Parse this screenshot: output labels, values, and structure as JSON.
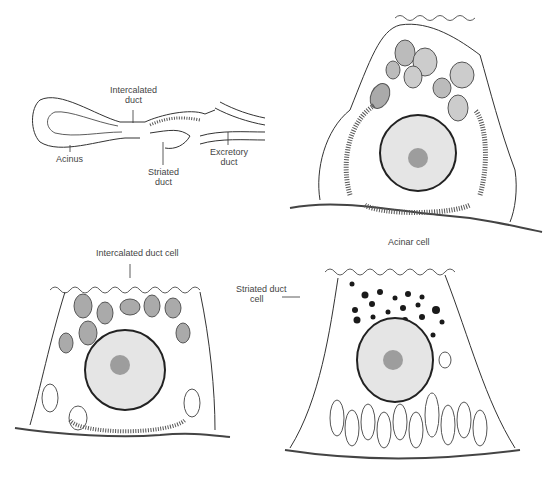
{
  "figure": {
    "panels": [
      {
        "id": "duct-system",
        "labels": {
          "intercalated_line1": "Intercalated",
          "intercalated_line2": "duct",
          "acinus": "Acinus",
          "striated_line1": "Striated",
          "striated_line2": "duct",
          "excretory_line1": "Excretory",
          "excretory_line2": "duct"
        }
      },
      {
        "id": "acinar-cell",
        "caption": "Acinar cell"
      },
      {
        "id": "intercalated-duct-cell",
        "caption": "Intercalated duct cell"
      },
      {
        "id": "striated-duct-cell",
        "caption_line1": "Striated duct",
        "caption_line2": "cell"
      }
    ],
    "colors": {
      "line": "#333333",
      "granule": "#9a9a9a",
      "dark_granule": "#1a1a1a",
      "nucleus_fill": "#d8d8d8",
      "background": "#ffffff"
    }
  }
}
